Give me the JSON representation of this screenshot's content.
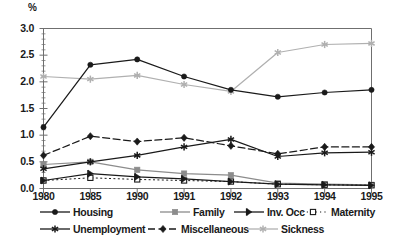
{
  "chart_data": {
    "type": "line",
    "title": "",
    "subtitle": "",
    "xlabel": "",
    "ylabel": "%",
    "unit_label": "%",
    "categories": [
      "1980",
      "1985",
      "1990",
      "1991",
      "1992",
      "1993",
      "1994",
      "1995"
    ],
    "x": [
      "1980",
      "1985",
      "1990",
      "1991",
      "1992",
      "1993",
      "1994",
      "1995"
    ],
    "ylim": [
      0.0,
      3.0
    ],
    "yticks": [
      "0.0",
      "0.5",
      "1.0",
      "1.5",
      "2.0",
      "2.5",
      "3.0"
    ],
    "ytick_values": [
      0.0,
      0.5,
      1.0,
      1.5,
      2.0,
      2.5,
      3.0
    ],
    "grid": false,
    "legend_position": "bottom",
    "series": [
      {
        "name": "Housing",
        "marker": "filled-circle",
        "line_style": "solid",
        "color": "#1a1a1a",
        "values": [
          1.15,
          2.32,
          2.42,
          2.1,
          1.85,
          1.72,
          1.8,
          1.85
        ]
      },
      {
        "name": "Family",
        "marker": "filled-square",
        "line_style": "solid",
        "color": "#8c8c8c",
        "values": [
          0.45,
          0.5,
          0.35,
          0.28,
          0.25,
          0.1,
          0.08,
          0.07
        ]
      },
      {
        "name": "Inv. Occ",
        "marker": "half-arrow",
        "line_style": "solid",
        "color": "#1a1a1a",
        "values": [
          0.15,
          0.28,
          0.22,
          0.18,
          0.13,
          0.08,
          0.07,
          0.06
        ]
      },
      {
        "name": "Maternity",
        "marker": "open-square",
        "line_style": "dotted",
        "color": "#1a1a1a",
        "values": [
          0.15,
          0.2,
          0.17,
          0.15,
          0.13,
          0.08,
          0.07,
          0.06
        ]
      },
      {
        "name": "Unemployment",
        "marker": "asterisk",
        "line_style": "solid",
        "color": "#1a1a1a",
        "values": [
          0.37,
          0.5,
          0.62,
          0.78,
          0.92,
          0.6,
          0.67,
          0.68
        ]
      },
      {
        "name": "Miscellaneous",
        "marker": "filled-diamond",
        "line_style": "dashed",
        "color": "#1a1a1a",
        "values": [
          0.62,
          0.98,
          0.88,
          0.95,
          0.8,
          0.65,
          0.78,
          0.78
        ]
      },
      {
        "name": "Sickness",
        "marker": "asterisk",
        "line_style": "solid",
        "color": "#b0b0b0",
        "values": [
          2.1,
          2.05,
          2.12,
          1.95,
          1.82,
          2.55,
          2.7,
          2.72
        ]
      }
    ]
  },
  "legend": {
    "items": [
      {
        "label": "Housing"
      },
      {
        "label": "Family"
      },
      {
        "label": "Inv. Occ"
      },
      {
        "label": "Maternity"
      },
      {
        "label": "Unemployment"
      },
      {
        "label": "Miscellaneous"
      },
      {
        "label": "Sickness"
      }
    ]
  },
  "axes": {
    "y_unit": "%",
    "y_labels": [
      "3.0",
      "2.5",
      "2.0",
      "1.5",
      "1.0",
      "0.5",
      "0.0"
    ],
    "x_labels": [
      "1980",
      "1985",
      "1990",
      "1991",
      "1992",
      "1993",
      "1994",
      "1995"
    ]
  },
  "colors": {
    "axis": "#6f6f6f",
    "text": "#1a1a1a",
    "dark_series": "#1a1a1a",
    "mid_gray_series": "#8c8c8c",
    "light_gray_series": "#b0b0b0"
  }
}
